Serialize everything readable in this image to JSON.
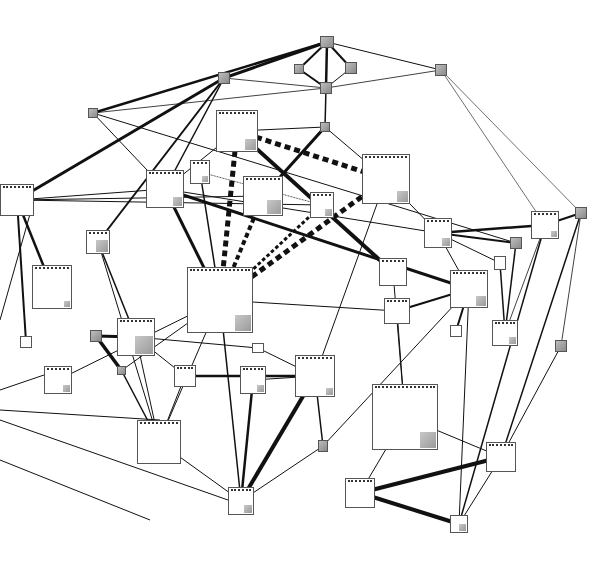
{
  "diagram": {
    "type": "network-graph",
    "nodes": [
      {
        "id": "n1",
        "x": 320,
        "y": 36,
        "w": 14,
        "h": 12,
        "filled": true
      },
      {
        "id": "n2",
        "x": 294,
        "y": 64,
        "w": 10,
        "h": 10,
        "filled": true
      },
      {
        "id": "n3",
        "x": 345,
        "y": 62,
        "w": 12,
        "h": 12,
        "filled": true
      },
      {
        "id": "n4",
        "x": 320,
        "y": 82,
        "w": 12,
        "h": 12,
        "filled": true
      },
      {
        "id": "n5",
        "x": 218,
        "y": 72,
        "w": 12,
        "h": 12,
        "filled": true
      },
      {
        "id": "n6",
        "x": 435,
        "y": 64,
        "w": 12,
        "h": 12,
        "filled": true
      },
      {
        "id": "n7",
        "x": 88,
        "y": 108,
        "w": 10,
        "h": 10,
        "filled": true
      },
      {
        "id": "n8",
        "x": 320,
        "y": 122,
        "w": 10,
        "h": 10,
        "filled": true
      },
      {
        "id": "n9",
        "x": 216,
        "y": 110,
        "w": 42,
        "h": 42,
        "corner": 11
      },
      {
        "id": "n10",
        "x": 190,
        "y": 160,
        "w": 20,
        "h": 24,
        "corner": 6
      },
      {
        "id": "n11",
        "x": 146,
        "y": 170,
        "w": 38,
        "h": 38,
        "corner": 9
      },
      {
        "id": "n12",
        "x": 243,
        "y": 176,
        "w": 40,
        "h": 40,
        "corner": 14
      },
      {
        "id": "n13",
        "x": 310,
        "y": 192,
        "w": 24,
        "h": 26,
        "corner": 7
      },
      {
        "id": "n14",
        "x": 362,
        "y": 154,
        "w": 48,
        "h": 50,
        "corner": 11
      },
      {
        "id": "n15",
        "x": 0,
        "y": 184,
        "w": 34,
        "h": 32,
        "corner": 0
      },
      {
        "id": "n16",
        "x": 86,
        "y": 230,
        "w": 24,
        "h": 24,
        "corner": 12
      },
      {
        "id": "n17",
        "x": 32,
        "y": 265,
        "w": 40,
        "h": 44,
        "corner": 6
      },
      {
        "id": "n18",
        "x": 187,
        "y": 267,
        "w": 66,
        "h": 66,
        "corner": 16
      },
      {
        "id": "n19",
        "x": 424,
        "y": 218,
        "w": 28,
        "h": 30,
        "corner": 8
      },
      {
        "id": "n20",
        "x": 510,
        "y": 237,
        "w": 12,
        "h": 12,
        "filled": true
      },
      {
        "id": "n21",
        "x": 494,
        "y": 256,
        "w": 12,
        "h": 14,
        "corner": 0
      },
      {
        "id": "n22",
        "x": 531,
        "y": 211,
        "w": 28,
        "h": 28,
        "corner": 6
      },
      {
        "id": "n23",
        "x": 575,
        "y": 207,
        "w": 12,
        "h": 12,
        "filled": true
      },
      {
        "id": "n24",
        "x": 379,
        "y": 258,
        "w": 28,
        "h": 28,
        "corner": 0
      },
      {
        "id": "n25",
        "x": 450,
        "y": 270,
        "w": 38,
        "h": 38,
        "corner": 10
      },
      {
        "id": "n26",
        "x": 384,
        "y": 298,
        "w": 26,
        "h": 26,
        "corner": 0
      },
      {
        "id": "n27",
        "x": 450,
        "y": 325,
        "w": 12,
        "h": 12,
        "corner": 0
      },
      {
        "id": "n28",
        "x": 492,
        "y": 320,
        "w": 26,
        "h": 26,
        "corner": 7
      },
      {
        "id": "n29",
        "x": 555,
        "y": 340,
        "w": 12,
        "h": 12,
        "filled": true
      },
      {
        "id": "n30",
        "x": 20,
        "y": 336,
        "w": 12,
        "h": 12,
        "corner": 0
      },
      {
        "id": "n31",
        "x": 90,
        "y": 330,
        "w": 12,
        "h": 12,
        "filled": true
      },
      {
        "id": "n32",
        "x": 117,
        "y": 318,
        "w": 38,
        "h": 38,
        "corner": 18
      },
      {
        "id": "n33",
        "x": 117,
        "y": 366,
        "w": 9,
        "h": 9,
        "filled": true
      },
      {
        "id": "n34",
        "x": 252,
        "y": 343,
        "w": 12,
        "h": 10,
        "corner": 0
      },
      {
        "id": "n35",
        "x": 44,
        "y": 366,
        "w": 28,
        "h": 28,
        "corner": 7
      },
      {
        "id": "n36",
        "x": 174,
        "y": 365,
        "w": 22,
        "h": 22,
        "corner": 0
      },
      {
        "id": "n37",
        "x": 240,
        "y": 366,
        "w": 26,
        "h": 28,
        "corner": 7
      },
      {
        "id": "n38",
        "x": 295,
        "y": 355,
        "w": 40,
        "h": 42,
        "corner": 7
      },
      {
        "id": "n39",
        "x": 372,
        "y": 384,
        "w": 66,
        "h": 66,
        "corner": 16
      },
      {
        "id": "n40",
        "x": 137,
        "y": 420,
        "w": 44,
        "h": 44,
        "corner": 0
      },
      {
        "id": "n41",
        "x": 318,
        "y": 440,
        "w": 10,
        "h": 12,
        "filled": true
      },
      {
        "id": "n42",
        "x": 486,
        "y": 442,
        "w": 30,
        "h": 30,
        "corner": 0
      },
      {
        "id": "n43",
        "x": 228,
        "y": 487,
        "w": 26,
        "h": 28,
        "corner": 8
      },
      {
        "id": "n44",
        "x": 345,
        "y": 478,
        "w": 30,
        "h": 30,
        "corner": 0
      },
      {
        "id": "n45",
        "x": 450,
        "y": 515,
        "w": 18,
        "h": 18,
        "corner": 7
      }
    ],
    "edges": [
      {
        "from": "n1",
        "to": "n2",
        "w": 2
      },
      {
        "from": "n1",
        "to": "n3",
        "w": 2
      },
      {
        "from": "n1",
        "to": "n4",
        "w": 2.5
      },
      {
        "from": "n2",
        "to": "n4",
        "w": 2
      },
      {
        "from": "n3",
        "to": "n4",
        "w": 1
      },
      {
        "from": "n1",
        "to": "n5",
        "w": 3
      },
      {
        "from": "n1",
        "to": "n7",
        "w": 2.5
      },
      {
        "from": "n1",
        "to": "n6",
        "w": 1
      },
      {
        "from": "n4",
        "to": "n6",
        "w": 0.8
      },
      {
        "from": "n4",
        "to": "n5",
        "w": 0.8
      },
      {
        "from": "n4",
        "to": "n7",
        "w": 0.8
      },
      {
        "from": "n4",
        "to": "n8",
        "w": 1.5
      },
      {
        "from": "n6",
        "to": "n22",
        "w": 0.6
      },
      {
        "from": "n6",
        "to": "n23",
        "w": 0.6
      },
      {
        "from": "n5",
        "to": "n15",
        "w": 3
      },
      {
        "from": "n5",
        "to": "n16",
        "w": 2
      },
      {
        "from": "n5",
        "to": "n11",
        "w": 1.5
      },
      {
        "from": "n7",
        "to": "n11",
        "w": 1
      },
      {
        "from": "n7",
        "to": "n20",
        "w": 1
      },
      {
        "from": "n8",
        "to": "n12",
        "w": 3
      },
      {
        "from": "n8",
        "to": "n9",
        "w": 1
      },
      {
        "from": "n9",
        "to": "n18",
        "w": 5,
        "dashed": true
      },
      {
        "from": "n9",
        "to": "n14",
        "w": 5,
        "dashed": true
      },
      {
        "from": "n9",
        "to": "n11",
        "w": 1
      },
      {
        "from": "n9",
        "to": "n24",
        "w": 4
      },
      {
        "from": "n14",
        "to": "n18",
        "w": 5,
        "dashed": true
      },
      {
        "from": "n13",
        "to": "n18",
        "w": 3,
        "dashed": true
      },
      {
        "from": "n12",
        "to": "n18",
        "w": 4,
        "dashed": true
      },
      {
        "from": "n12",
        "to": "n8",
        "w": 2
      },
      {
        "from": "n10",
        "to": "n18",
        "w": 1.5
      },
      {
        "from": "n10",
        "to": "n13",
        "w": 0.8,
        "dashed": true
      },
      {
        "from": "n11",
        "to": "n18",
        "w": 3
      },
      {
        "from": "n11",
        "to": "n25",
        "w": 3
      },
      {
        "from": "n11",
        "to": "n19",
        "w": 1
      },
      {
        "from": "n14",
        "to": "n38",
        "w": 1
      },
      {
        "from": "n14",
        "to": "n8",
        "w": 1
      },
      {
        "from": "n14",
        "to": "n19",
        "w": 1
      },
      {
        "from": "n15",
        "to": "n11",
        "w": 1
      },
      {
        "from": "n15",
        "to": "n12",
        "w": 1
      },
      {
        "from": "n15",
        "to": "n13",
        "w": 1
      },
      {
        "from": "n15",
        "to": "n17",
        "w": 2.5
      },
      {
        "from": "n15",
        "to": "n30",
        "w": 2
      },
      {
        "from": "n16",
        "to": "n32",
        "w": 1.5
      },
      {
        "from": "n16",
        "to": "n40",
        "w": 1
      },
      {
        "from": "n18",
        "to": "n35",
        "w": 1
      },
      {
        "from": "n18",
        "to": "n43",
        "w": 1.5
      },
      {
        "from": "n18",
        "to": "n40",
        "w": 1
      },
      {
        "from": "n18",
        "to": "n26",
        "w": 1
      },
      {
        "from": "n18",
        "to": "n33",
        "w": 1
      },
      {
        "from": "n19",
        "to": "n22",
        "w": 2.5
      },
      {
        "from": "n19",
        "to": "n20",
        "w": 2
      },
      {
        "from": "n19",
        "to": "n21",
        "w": 1
      },
      {
        "from": "n19",
        "to": "n25",
        "w": 1
      },
      {
        "from": "n20",
        "to": "n28",
        "w": 1.5
      },
      {
        "from": "n21",
        "to": "n28",
        "w": 1.5
      },
      {
        "from": "n22",
        "to": "n23",
        "w": 2
      },
      {
        "from": "n22",
        "to": "n28",
        "w": 0.8
      },
      {
        "from": "n22",
        "to": "n45",
        "w": 1.5
      },
      {
        "from": "n23",
        "to": "n29",
        "w": 0.8
      },
      {
        "from": "n23",
        "to": "n42",
        "w": 1.5
      },
      {
        "from": "n25",
        "to": "n26",
        "w": 2
      },
      {
        "from": "n25",
        "to": "n27",
        "w": 2
      },
      {
        "from": "n25",
        "to": "n41",
        "w": 1
      },
      {
        "from": "n24",
        "to": "n39",
        "w": 1
      },
      {
        "from": "n26",
        "to": "n39",
        "w": 1
      },
      {
        "from": "n31",
        "to": "n33",
        "w": 3.5
      },
      {
        "from": "n31",
        "to": "n32",
        "w": 3
      },
      {
        "from": "n32",
        "to": "n36",
        "w": 1
      },
      {
        "from": "n32",
        "to": "n40",
        "w": 1
      },
      {
        "from": "n33",
        "to": "n40",
        "w": 1.5
      },
      {
        "from": "n32",
        "to": "n34",
        "w": 1
      },
      {
        "from": "n34",
        "to": "n38",
        "w": 1
      },
      {
        "from": "n36",
        "to": "n38",
        "w": 2.5
      },
      {
        "from": "n36",
        "to": "n40",
        "w": 1
      },
      {
        "from": "n37",
        "to": "n38",
        "w": 1
      },
      {
        "from": "n37",
        "to": "n43",
        "w": 2.5
      },
      {
        "from": "n38",
        "to": "n43",
        "w": 4
      },
      {
        "from": "n38",
        "to": "n41",
        "w": 1.5
      },
      {
        "from": "n41",
        "to": "n43",
        "w": 1
      },
      {
        "from": "n40",
        "to": "n43",
        "w": 1
      },
      {
        "from": "n40",
        "to": "n0L",
        "w": 1
      },
      {
        "from": "n39",
        "to": "n44",
        "w": 1
      },
      {
        "from": "n39",
        "to": "n42",
        "w": 1
      },
      {
        "from": "n44",
        "to": "n42",
        "w": 4
      },
      {
        "from": "n44",
        "to": "n45",
        "w": 4
      },
      {
        "from": "n42",
        "to": "n45",
        "w": 1
      },
      {
        "from": "n25",
        "to": "n45",
        "w": 1
      },
      {
        "from": "n29",
        "to": "n42",
        "w": 1
      }
    ],
    "stub_edges": [
      {
        "x1": 0,
        "y1": 390,
        "x2": 44,
        "y2": 375,
        "w": 1
      },
      {
        "x1": 0,
        "y1": 410,
        "x2": 160,
        "y2": 420,
        "w": 1
      },
      {
        "x1": 0,
        "y1": 420,
        "x2": 228,
        "y2": 500,
        "w": 1
      },
      {
        "x1": 0,
        "y1": 460,
        "x2": 150,
        "y2": 520,
        "w": 1
      },
      {
        "x1": 0,
        "y1": 320,
        "x2": 34,
        "y2": 200,
        "w": 1
      },
      {
        "x1": 0,
        "y1": 300,
        "x2": 0,
        "y2": 300,
        "w": 1
      }
    ]
  }
}
